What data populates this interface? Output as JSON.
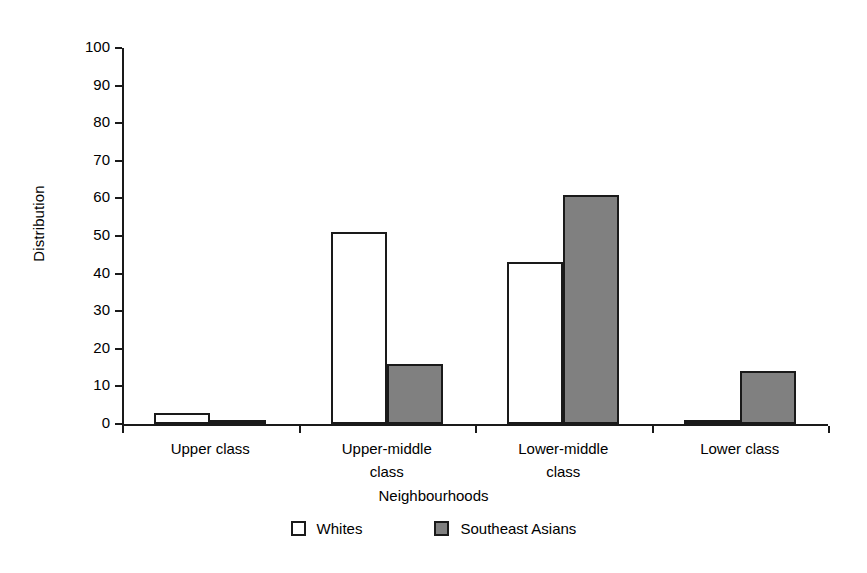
{
  "chart_data": {
    "type": "bar",
    "title": "",
    "xlabel": "Neighbourhoods",
    "ylabel": "Distribution",
    "categories": [
      "Upper class",
      "Upper-middle class",
      "Lower-middle class",
      "Lower class"
    ],
    "category_lines": [
      [
        "Upper class"
      ],
      [
        "Upper-middle",
        "class"
      ],
      [
        "Lower-middle",
        "class"
      ],
      [
        "Lower class"
      ]
    ],
    "series": [
      {
        "name": "Whites",
        "color": "#ffffff",
        "values": [
          3,
          51,
          43,
          1
        ]
      },
      {
        "name": "Southeast Asians",
        "color": "#808080",
        "values": [
          1,
          16,
          61,
          14
        ]
      }
    ],
    "ylim": [
      0,
      100
    ],
    "ytick_step": 10,
    "yticks": [
      100,
      90,
      80,
      70,
      60,
      50,
      40,
      30,
      20,
      10,
      0
    ],
    "grid": false,
    "legend_position": "bottom"
  },
  "legend": {
    "items": [
      {
        "label": "Whites",
        "swatch": "white-square-swatch"
      },
      {
        "label": "Southeast Asians",
        "swatch": "gray-square-swatch"
      }
    ]
  },
  "colors": {
    "axis": "#1a1a1a",
    "whites_fill": "#ffffff",
    "southeast_asians_fill": "#808080",
    "background": "#ffffff"
  }
}
